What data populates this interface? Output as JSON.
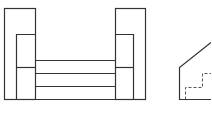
{
  "drawing": {
    "type": "orthographic-projection",
    "views": [
      {
        "name": "front-view",
        "description": "Two upright blocks connected by three stacked horizontal plates"
      },
      {
        "name": "side-view",
        "description": "Profile with sloped top and hidden (dashed) stepped edges"
      }
    ],
    "colors": {
      "line": "#333333",
      "hidden_line": "#555555",
      "background": "#ffffff"
    }
  }
}
